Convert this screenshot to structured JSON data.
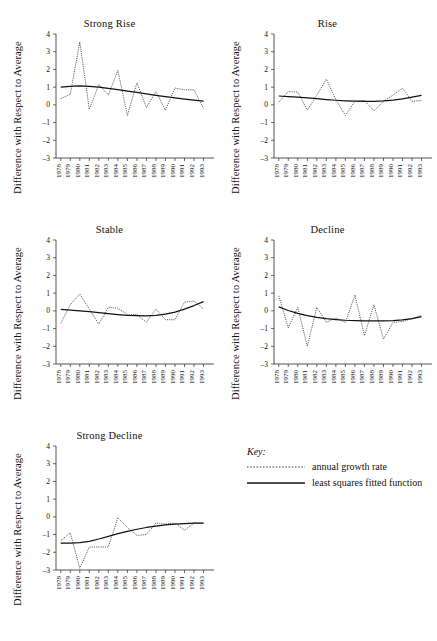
{
  "figure": {
    "ylabel": "Difference with Respect to Average",
    "y_ticks": [
      "4",
      "3",
      "2",
      "1",
      "0",
      "-1",
      "-2",
      "-3"
    ],
    "x_ticks": [
      "1978",
      "1979",
      "1980",
      "1981",
      "1982",
      "1983",
      "1984",
      "1985",
      "1986",
      "1987",
      "1988",
      "1989",
      "1990",
      "1991",
      "1992",
      "1993"
    ]
  },
  "key": {
    "title": "Key:",
    "items": [
      {
        "label": "annual growth rate",
        "style": "dotted",
        "icon": "dotted-line-icon"
      },
      {
        "label": "least squares fitted function",
        "style": "solid",
        "icon": "solid-line-icon"
      }
    ]
  },
  "chart_data": [
    {
      "type": "line",
      "title": "Strong Rise",
      "xlabel": "",
      "ylabel": "Difference with Respect to Average",
      "x": [
        1978,
        1979,
        1980,
        1981,
        1982,
        1983,
        1984,
        1985,
        1986,
        1987,
        1988,
        1989,
        1990,
        1991,
        1992,
        1993
      ],
      "ylim": [
        -3,
        4
      ],
      "xlim": [
        1977.5,
        1993.8
      ],
      "grid": false,
      "series": [
        {
          "name": "annual growth rate",
          "style": "dotted",
          "values": [
            0.35,
            0.6,
            3.55,
            -0.25,
            1.15,
            0.55,
            1.95,
            -0.6,
            1.25,
            -0.15,
            0.75,
            -0.3,
            0.95,
            0.85,
            0.85,
            -0.2
          ]
        },
        {
          "name": "least squares fitted function",
          "style": "solid",
          "values": [
            1.0,
            1.05,
            1.07,
            1.05,
            1.0,
            0.93,
            0.86,
            0.78,
            0.7,
            0.62,
            0.54,
            0.47,
            0.4,
            0.33,
            0.27,
            0.21
          ]
        }
      ]
    },
    {
      "type": "line",
      "title": "Rise",
      "xlabel": "",
      "ylabel": "Difference with Respect to Average",
      "x": [
        1978,
        1979,
        1980,
        1981,
        1982,
        1983,
        1984,
        1985,
        1986,
        1987,
        1988,
        1989,
        1990,
        1991,
        1992,
        1993
      ],
      "ylim": [
        -3,
        4
      ],
      "xlim": [
        1977.5,
        1993.8
      ],
      "grid": false,
      "series": [
        {
          "name": "annual growth rate",
          "style": "dotted",
          "values": [
            0.15,
            0.75,
            0.72,
            -0.3,
            0.55,
            1.45,
            0.3,
            -0.6,
            0.2,
            0.25,
            -0.35,
            0.2,
            0.55,
            0.95,
            0.2,
            0.25
          ]
        },
        {
          "name": "least squares fitted function",
          "style": "solid",
          "values": [
            0.5,
            0.47,
            0.44,
            0.4,
            0.35,
            0.3,
            0.26,
            0.23,
            0.21,
            0.2,
            0.2,
            0.22,
            0.27,
            0.34,
            0.43,
            0.53
          ]
        }
      ]
    },
    {
      "type": "line",
      "title": "Stable",
      "xlabel": "",
      "ylabel": "Difference with Respect to Average",
      "x": [
        1978,
        1979,
        1980,
        1981,
        1982,
        1983,
        1984,
        1985,
        1986,
        1987,
        1988,
        1989,
        1990,
        1991,
        1992,
        1993
      ],
      "ylim": [
        -3,
        4
      ],
      "xlim": [
        1977.5,
        1993.8
      ],
      "grid": false,
      "series": [
        {
          "name": "annual growth rate",
          "style": "dotted",
          "values": [
            -0.7,
            0.35,
            0.95,
            0.1,
            -0.75,
            0.2,
            0.15,
            -0.2,
            -0.2,
            -0.65,
            0.1,
            -0.5,
            -0.5,
            0.5,
            0.55,
            0.1
          ]
        },
        {
          "name": "least squares fitted function",
          "style": "solid",
          "values": [
            0.08,
            0.04,
            0.0,
            -0.05,
            -0.1,
            -0.16,
            -0.21,
            -0.25,
            -0.27,
            -0.28,
            -0.25,
            -0.18,
            -0.07,
            0.1,
            0.3,
            0.52
          ]
        }
      ]
    },
    {
      "type": "line",
      "title": "Decline",
      "xlabel": "",
      "ylabel": "Difference with Respect to Average",
      "x": [
        1978,
        1979,
        1980,
        1981,
        1982,
        1983,
        1984,
        1985,
        1986,
        1987,
        1988,
        1989,
        1990,
        1991,
        1992,
        1993
      ],
      "ylim": [
        -3,
        4
      ],
      "xlim": [
        1977.5,
        1993.8
      ],
      "grid": false,
      "series": [
        {
          "name": "annual growth rate",
          "style": "dotted",
          "values": [
            0.85,
            -0.95,
            0.2,
            -2.0,
            0.2,
            -0.65,
            -0.4,
            -0.65,
            0.9,
            -1.4,
            0.35,
            -1.6,
            -0.65,
            -0.6,
            -0.45,
            -0.25
          ]
        },
        {
          "name": "least squares fitted function",
          "style": "solid",
          "values": [
            0.22,
            0.02,
            -0.14,
            -0.27,
            -0.37,
            -0.44,
            -0.49,
            -0.53,
            -0.55,
            -0.56,
            -0.57,
            -0.57,
            -0.55,
            -0.51,
            -0.44,
            -0.33
          ]
        }
      ]
    },
    {
      "type": "line",
      "title": "Strong Decline",
      "xlabel": "",
      "ylabel": "Difference with Respect to Average",
      "x": [
        1978,
        1979,
        1980,
        1981,
        1982,
        1983,
        1984,
        1985,
        1986,
        1987,
        1988,
        1989,
        1990,
        1991,
        1992,
        1993
      ],
      "ylim": [
        -3,
        4
      ],
      "xlim": [
        1977.5,
        1993.8
      ],
      "grid": false,
      "series": [
        {
          "name": "annual growth rate",
          "style": "dotted",
          "values": [
            -1.35,
            -0.9,
            -2.9,
            -1.7,
            -1.7,
            -1.7,
            -0.05,
            -0.6,
            -1.05,
            -1.0,
            -0.35,
            -0.4,
            -0.35,
            -0.75,
            -0.35,
            -0.35
          ]
        },
        {
          "name": "least squares fitted function",
          "style": "solid",
          "values": [
            -1.48,
            -1.48,
            -1.45,
            -1.38,
            -1.25,
            -1.1,
            -0.95,
            -0.82,
            -0.7,
            -0.6,
            -0.52,
            -0.45,
            -0.41,
            -0.38,
            -0.36,
            -0.35
          ]
        }
      ]
    }
  ]
}
